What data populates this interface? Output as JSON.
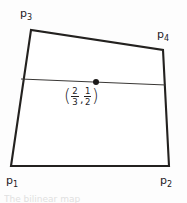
{
  "figure": {
    "background_color": "#fdfdfd",
    "stroke_color": "#23211f",
    "interior_line_color": "#3a3836",
    "quadrilateral": {
      "vertices": [
        {
          "name": "p1",
          "x": 11,
          "y": 166
        },
        {
          "name": "p2",
          "x": 169,
          "y": 166
        },
        {
          "name": "p3",
          "x": 31,
          "y": 30
        },
        {
          "name": "p4",
          "x": 163,
          "y": 50
        }
      ],
      "path": "M 11 166 L 169 166 L 163 50 L 31 30 Z"
    },
    "interior_line": {
      "x1": 21,
      "y1": 79,
      "x2": 166,
      "y2": 85
    },
    "marked_point": {
      "x": 96,
      "y": 82,
      "radius": 3
    }
  },
  "labels": {
    "p1": {
      "base": "p",
      "sub": "1"
    },
    "p2": {
      "base": "p",
      "sub": "2"
    },
    "p3": {
      "base": "p",
      "sub": "3"
    },
    "p4": {
      "base": "p",
      "sub": "4"
    }
  },
  "point_coordinate": {
    "open_paren": "(",
    "close_paren": ")",
    "separator": ",",
    "x_fraction": {
      "numerator": "2",
      "denominator": "3"
    },
    "y_fraction": {
      "numerator": "1",
      "denominator": "2"
    }
  },
  "bottom_caption": {
    "clipped_text": "The bilinear map"
  }
}
